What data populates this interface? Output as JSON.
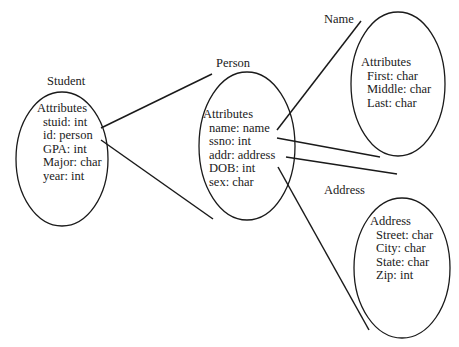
{
  "diagram": {
    "entities": [
      {
        "id": "student",
        "title": "Student",
        "section": "Attributes",
        "attributes": [
          "stuid: int",
          "id: person",
          "GPA: int",
          "Major: char",
          "year: int"
        ]
      },
      {
        "id": "person",
        "title": "Person",
        "section": "Attributes",
        "attributes": [
          "name: name",
          "ssno: int",
          "addr: address",
          "DOB: int",
          "sex: char"
        ]
      },
      {
        "id": "name",
        "title": "Name",
        "section": "Attributes",
        "attributes": [
          "First: char",
          "Middle: char",
          "Last: char"
        ]
      },
      {
        "id": "address",
        "title": "Address",
        "section": "Address",
        "attributes": [
          "Street: char",
          "City: char",
          "State: char",
          "Zip: int"
        ]
      }
    ],
    "connections": [
      {
        "from": "student.id",
        "to": "person"
      },
      {
        "from": "person.name",
        "to": "name"
      },
      {
        "from": "person.addr",
        "to": "address"
      }
    ],
    "colors": {
      "stroke": "#1a1a1a",
      "background": "#ffffff"
    }
  }
}
